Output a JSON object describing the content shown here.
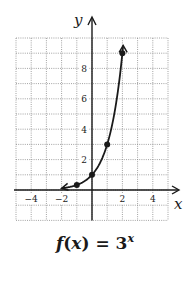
{
  "chart_data": {
    "type": "line",
    "function": "3^x",
    "xlabel": "x",
    "ylabel": "y",
    "xlim": [
      -5,
      5
    ],
    "ylim": [
      -2,
      10
    ],
    "x_ticks": [
      -4,
      -2,
      2,
      4
    ],
    "y_ticks": [
      2,
      4,
      6,
      8
    ],
    "grid": true,
    "grid_style": "dotted",
    "points": [
      {
        "x": -1,
        "y": 0.333
      },
      {
        "x": 0,
        "y": 1
      },
      {
        "x": 1,
        "y": 3
      },
      {
        "x": 2,
        "y": 9
      }
    ],
    "curve_domain": [
      -2,
      2.05
    ],
    "arrows": [
      "left-end",
      "top-end"
    ]
  },
  "caption": {
    "f": "f",
    "open": "(",
    "x": "x",
    "close_eq": ") = 3",
    "exponent": "x"
  },
  "axes": {
    "x_label": "x",
    "y_label": "y",
    "tick_labels_x": [
      "−4",
      "−2",
      "2",
      "4"
    ],
    "tick_labels_y": [
      "2",
      "4",
      "6",
      "8"
    ]
  },
  "colors": {
    "ink": "#1a1a1a",
    "grid": "#8a8a8a",
    "background": "#ffffff"
  }
}
